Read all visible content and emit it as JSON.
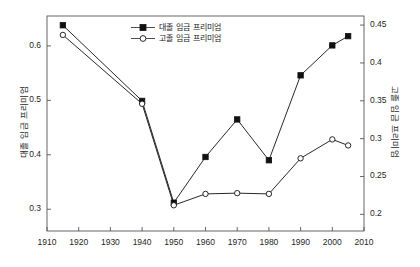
{
  "chart_data": {
    "type": "line",
    "title": "",
    "xlabel": "",
    "ylabel": "대졸 임금 프리미엄",
    "ylabel_right": "고졸 임금 프리미엄",
    "xlim": [
      1910,
      2010
    ],
    "ylim": [
      0.26,
      0.655
    ],
    "ylim_right": [
      0.178,
      0.462
    ],
    "grid": false,
    "legend_position": "top-center",
    "xticks": [
      1910,
      1920,
      1930,
      1940,
      1950,
      1960,
      1970,
      1980,
      1990,
      2000,
      2010
    ],
    "xtick_labels": [
      "1910",
      "1920",
      "1930",
      "1940",
      "1950",
      "1960",
      "1970",
      "1980",
      "1990",
      "2000",
      "2010"
    ],
    "yticks_left": [
      0.3,
      0.4,
      0.5,
      0.6
    ],
    "ytick_labels_left": [
      "0.3",
      "0.4",
      "0.5",
      "0.6"
    ],
    "yticks_right": [
      0.2,
      0.25,
      0.3,
      0.35,
      0.4,
      0.45
    ],
    "ytick_labels_right": [
      "0.2",
      "0.25",
      "0.3",
      "0.35",
      "0.4",
      "0.45"
    ],
    "x": [
      1915,
      1940,
      1950,
      1960,
      1970,
      1980,
      1990,
      2000,
      2005
    ],
    "series": [
      {
        "name": "대졸 임금 프리미엄",
        "axis": "left",
        "marker": "filled-square",
        "color": "#111111",
        "values": [
          0.638,
          0.499,
          0.312,
          0.396,
          0.465,
          0.39,
          0.546,
          0.601,
          0.618
        ]
      },
      {
        "name": "고졸 임금 프리미엄",
        "axis": "right",
        "marker": "open-circle",
        "color": "#111111",
        "values": [
          0.437,
          0.346,
          0.212,
          0.227,
          0.228,
          0.227,
          0.274,
          0.299,
          0.291
        ]
      }
    ]
  },
  "legend": {
    "items": [
      {
        "label": "대졸 임금 프리미엄",
        "marker": "filled-square"
      },
      {
        "label": "고졸 임금 프리미엄",
        "marker": "open-circle"
      }
    ]
  }
}
